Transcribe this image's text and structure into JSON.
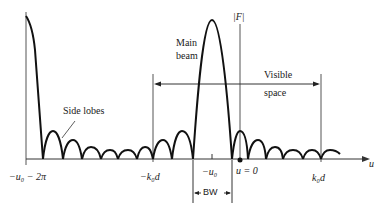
{
  "diagram": {
    "axis": {
      "vertical_label": "|F|",
      "horizontal_label": "u"
    },
    "labels": {
      "main_beam_line1": "Main",
      "main_beam_line2": "beam",
      "side_lobes": "Side lobes",
      "visible_line1": "Visible",
      "visible_line2": "space",
      "bandwidth": "BW"
    },
    "tick_labels": {
      "left_limit": "−u₀ − 2π",
      "minus_k0d": "−k₀d",
      "minus_u0": "−u₀",
      "u_zero": "u = 0",
      "k0d": "k₀d"
    },
    "colors": {
      "curve": "#111111",
      "axis": "#333333",
      "background": "#ffffff"
    }
  }
}
